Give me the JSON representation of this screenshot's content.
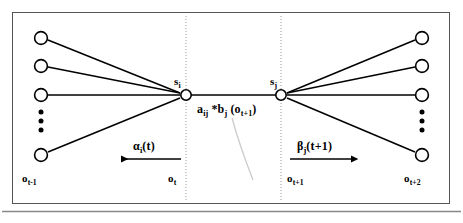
{
  "figure": {
    "type": "hmm-trellis-diagram",
    "frame_color": "#555555",
    "line_color": "#000000",
    "guide_color": "#999999",
    "leader_color": "#c8c8c8"
  },
  "states": {
    "left": {
      "label": "s",
      "subscript": "i",
      "cx": 186,
      "cy": 95
    },
    "right": {
      "label": "s",
      "subscript": "j",
      "cx": 281,
      "cy": 95
    }
  },
  "transition": {
    "label_a": "a",
    "label_a_sub": "ij",
    "operator": "*",
    "label_b": "b",
    "label_b_sub": "j",
    "label_obs_open": "(o",
    "label_obs_sub": "t+1",
    "label_obs_close": ")"
  },
  "alpha": {
    "symbol": "α",
    "subscript": "i",
    "arg": "(t)",
    "direction": "left"
  },
  "beta": {
    "symbol": "β",
    "subscript": "j",
    "arg": "(t+1)",
    "direction": "right"
  },
  "observations": [
    {
      "name": "o",
      "subscript": "t-1",
      "x": 22,
      "y": 178
    },
    {
      "name": "o",
      "subscript": "t",
      "x": 168,
      "y": 178
    },
    {
      "name": "o",
      "subscript": "t+1",
      "x": 287,
      "y": 178
    },
    {
      "name": "o",
      "subscript": "t+2",
      "x": 404,
      "y": 178
    }
  ],
  "left_nodes": [
    {
      "cx": 41,
      "cy": 38
    },
    {
      "cx": 41,
      "cy": 66
    },
    {
      "cx": 41,
      "cy": 95
    },
    {
      "cx": 41,
      "cy": 155
    }
  ],
  "right_nodes": [
    {
      "cx": 422,
      "cy": 38
    },
    {
      "cx": 422,
      "cy": 66
    },
    {
      "cx": 422,
      "cy": 95
    },
    {
      "cx": 422,
      "cy": 155
    }
  ],
  "left_ellipsis": {
    "cx": 41,
    "cy": 118,
    "dots": 3
  },
  "right_ellipsis": {
    "cx": 422,
    "cy": 118,
    "dots": 3
  },
  "guides": [
    {
      "x": 186
    },
    {
      "x": 281
    }
  ]
}
